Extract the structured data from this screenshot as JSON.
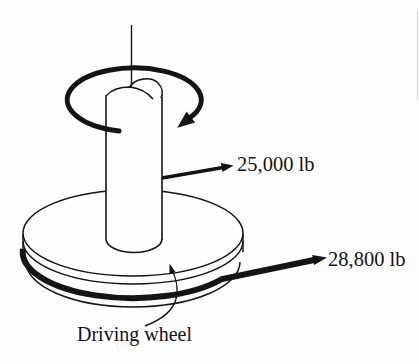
{
  "diagram": {
    "background": "#fdfdfd",
    "ink_color": "#141414",
    "labels": {
      "upper_force": "25,000 lb",
      "lower_force": "28,800 lb",
      "wheel_caption": "Driving wheel"
    },
    "icons": {
      "rotation_arrow": "curved-rotation-arrow",
      "force_arrows": "straight-force-arrow",
      "caption_leader": "curved-leader-arrow"
    }
  }
}
